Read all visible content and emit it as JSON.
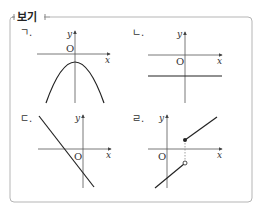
{
  "box": {
    "title": "보기",
    "border_color": "#b5b5b5"
  },
  "graphs": [
    {
      "label": "ㄱ.",
      "x_axis": "x",
      "y_axis": "y",
      "origin": "O",
      "description": "downward parabola with vertex below origin on y-axis"
    },
    {
      "label": "ㄴ.",
      "x_axis": "x",
      "y_axis": "y",
      "origin": "O",
      "description": "horizontal line below x-axis"
    },
    {
      "label": "ㄷ.",
      "x_axis": "x",
      "y_axis": "y",
      "origin": "O",
      "description": "decreasing line with negative x-intercept and negative y-intercept"
    },
    {
      "label": "ㄹ.",
      "x_axis": "x",
      "y_axis": "y",
      "origin": "O",
      "description": "piecewise line with jump at positive x: closed dot above x-axis, open dot below, dotted vertical connector"
    }
  ],
  "colors": {
    "curve": "#222222",
    "axis": "#555555",
    "frame": "#b5b5b5"
  }
}
